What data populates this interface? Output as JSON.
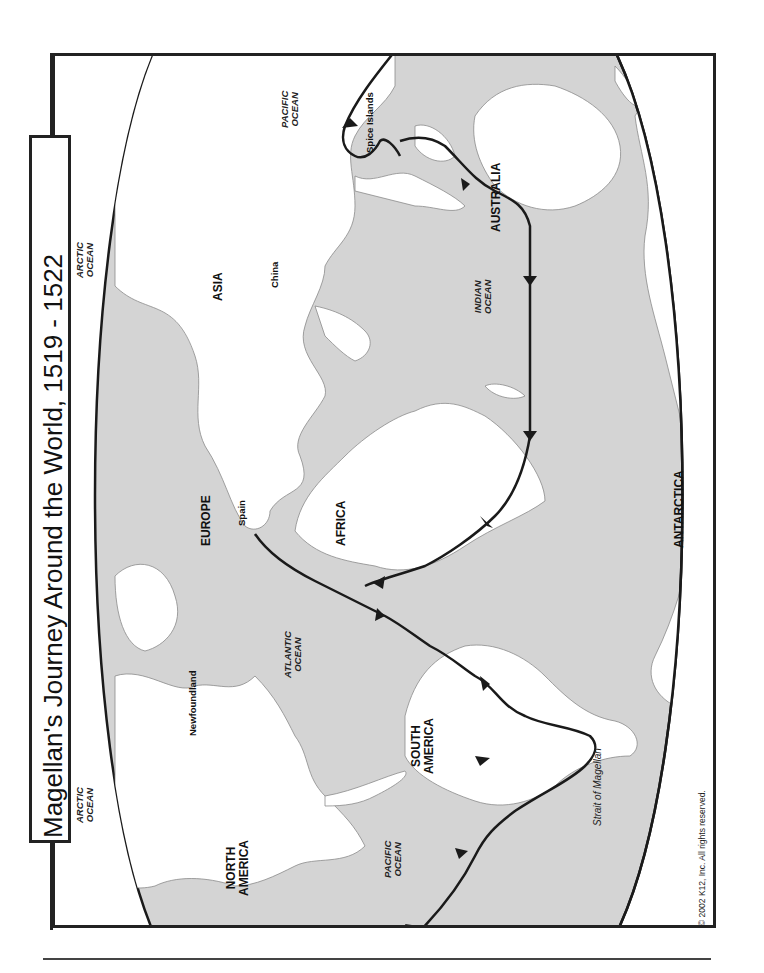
{
  "title": "Magellan's Journey Around the World, 1519 - 1522",
  "copyright": "© 2002 K12, Inc. All rights reserved.",
  "colors": {
    "ocean": "#d4d4d4",
    "land": "#ffffff",
    "coast_outline": "#777777",
    "route": "#1a1a1a",
    "frame": "#222222"
  },
  "orientation": "rotated 90° counter-clockwise (north points left)",
  "continents": [
    {
      "id": "asia",
      "label": "ASIA"
    },
    {
      "id": "europe",
      "label": "EUROPE"
    },
    {
      "id": "africa",
      "label": "AFRICA"
    },
    {
      "id": "australia",
      "label": "AUSTRALIA"
    },
    {
      "id": "north_america",
      "label": "NORTH AMERICA",
      "line1": "NORTH",
      "line2": "AMERICA"
    },
    {
      "id": "south_america",
      "label": "SOUTH AMERICA",
      "line1": "SOUTH",
      "line2": "AMERICA"
    },
    {
      "id": "antarctica",
      "label": "ANTARCTICA"
    }
  ],
  "oceans": [
    {
      "id": "arctic_east",
      "line1": "ARCTIC",
      "line2": "OCEAN"
    },
    {
      "id": "arctic_west",
      "line1": "ARCTIC",
      "line2": "OCEAN"
    },
    {
      "id": "pacific_east",
      "line1": "PACIFIC",
      "line2": "OCEAN"
    },
    {
      "id": "pacific_west",
      "line1": "PACIFIC",
      "line2": "OCEAN"
    },
    {
      "id": "atlantic",
      "line1": "ATLANTIC",
      "line2": "OCEAN"
    },
    {
      "id": "indian",
      "line1": "INDIAN",
      "line2": "OCEAN"
    }
  ],
  "places": [
    {
      "id": "china",
      "label": "China"
    },
    {
      "id": "spain",
      "label": "Spain"
    },
    {
      "id": "newfoundland",
      "label": "Newfoundland"
    },
    {
      "id": "spice_islands",
      "label": "Spice Islands"
    },
    {
      "id": "strait_of_magellan",
      "label": "Strait of Magellan"
    }
  ],
  "route": {
    "name": "Magellan's route",
    "stops": [
      "Spain",
      "Atlantic Ocean",
      "South America coast",
      "Strait of Magellan",
      "Pacific Ocean",
      "Spice Islands",
      "Indian Ocean",
      "Cape of Good Hope",
      "Spain"
    ]
  }
}
